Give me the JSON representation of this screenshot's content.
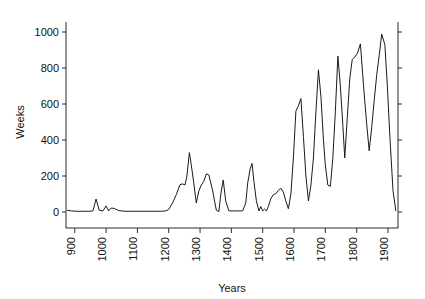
{
  "chart_data": {
    "type": "line",
    "title": "",
    "subtitle": "",
    "xlabel": "Years",
    "ylabel": "Weeks",
    "xlim": [
      872,
      1932
    ],
    "ylim": [
      0,
      1080
    ],
    "grid": false,
    "legend": null,
    "legend_position": "none",
    "x_ticks": [
      900,
      1000,
      1100,
      1200,
      1300,
      1400,
      1500,
      1600,
      1700,
      1800,
      1900
    ],
    "x_tick_labels": [
      "900",
      "1000",
      "1100",
      "1200",
      "1300",
      "1400",
      "1500",
      "1600",
      "1700",
      "1800",
      "1900"
    ],
    "y_ticks": [
      0,
      200,
      400,
      600,
      800,
      1000
    ],
    "y_tick_labels": [
      "0",
      "200",
      "400",
      "600",
      "800",
      "1000"
    ],
    "right_axis": {
      "visible": true,
      "labels": [],
      "tick_count": 6
    },
    "series": [
      {
        "name": "Weeks",
        "color": "#1a1a1a",
        "x": [
          875,
          890,
          905,
          925,
          945,
          958,
          968,
          978,
          990,
          1000,
          1008,
          1016,
          1026,
          1040,
          1060,
          1090,
          1120,
          1150,
          1175,
          1190,
          1200,
          1212,
          1224,
          1236,
          1244,
          1252,
          1258,
          1266,
          1272,
          1280,
          1288,
          1296,
          1304,
          1312,
          1320,
          1328,
          1340,
          1352,
          1360,
          1366,
          1374,
          1382,
          1392,
          1404,
          1420,
          1436,
          1446,
          1452,
          1460,
          1466,
          1472,
          1480,
          1488,
          1494,
          1500,
          1506,
          1512,
          1518,
          1526,
          1534,
          1542,
          1550,
          1558,
          1566,
          1574,
          1582,
          1590,
          1598,
          1606,
          1614,
          1622,
          1630,
          1638,
          1646,
          1654,
          1662,
          1670,
          1678,
          1686,
          1694,
          1700,
          1708,
          1716,
          1724,
          1732,
          1740,
          1748,
          1756,
          1762,
          1770,
          1778,
          1786,
          1794,
          1802,
          1812,
          1822,
          1832,
          1840,
          1848,
          1856,
          1864,
          1872,
          1880,
          1890,
          1898,
          1906,
          1916,
          1925
        ],
        "y": [
          10,
          6,
          4,
          4,
          4,
          6,
          72,
          10,
          6,
          34,
          6,
          22,
          20,
          8,
          4,
          4,
          4,
          4,
          4,
          6,
          14,
          50,
          96,
          152,
          156,
          150,
          200,
          330,
          262,
          160,
          50,
          116,
          150,
          170,
          212,
          206,
          120,
          10,
          2,
          96,
          178,
          60,
          6,
          6,
          6,
          6,
          50,
          160,
          240,
          270,
          170,
          60,
          6,
          30,
          6,
          16,
          6,
          30,
          74,
          96,
          102,
          120,
          132,
          110,
          60,
          18,
          100,
          300,
          560,
          590,
          630,
          420,
          200,
          62,
          150,
          300,
          560,
          790,
          640,
          400,
          260,
          150,
          142,
          300,
          560,
          866,
          700,
          480,
          300,
          520,
          740,
          848,
          860,
          880,
          934,
          700,
          490,
          340,
          470,
          620,
          760,
          870,
          988,
          930,
          700,
          420,
          120,
          6
        ]
      }
    ]
  },
  "geometry": {
    "plot_left": 66,
    "plot_right": 398,
    "plot_top": 22,
    "plot_bottom": 228,
    "y_zero_px": 212,
    "y_top_value_px": 32
  }
}
